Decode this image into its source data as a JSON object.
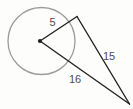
{
  "figure": {
    "type": "geometry-diagram",
    "labels": {
      "radius": "5",
      "tangent": "15",
      "secant": "16"
    },
    "colors": {
      "circle_stroke": "#9b9b9b",
      "line_stroke": "#242424",
      "dot_fill": "#1a1a1a",
      "label_text": "#4d4d4d",
      "background": "#fdfdfc"
    }
  }
}
